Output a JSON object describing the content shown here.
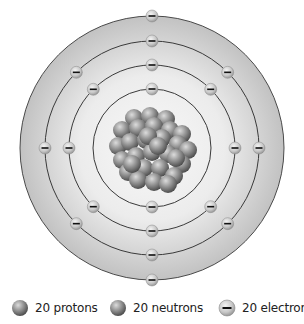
{
  "diagram": {
    "type": "bohr-atom-model",
    "element_counts": {
      "protons": 20,
      "neutrons": 20,
      "electrons": 20
    },
    "center": [
      152,
      148
    ],
    "disk_radius": 132,
    "shells": [
      {
        "radius": 59,
        "electrons": 2,
        "angles_deg": [
          90,
          270
        ]
      },
      {
        "radius": 83,
        "electrons": 8,
        "angles_deg": [
          0,
          45,
          90,
          135,
          180,
          225,
          270,
          315
        ]
      },
      {
        "radius": 107,
        "electrons": 8,
        "angles_deg": [
          0,
          45,
          90,
          135,
          180,
          225,
          270,
          315
        ]
      },
      {
        "radius": 132,
        "electrons": 2,
        "angles_deg": [
          90,
          270
        ]
      }
    ],
    "colors": {
      "disk_inner": "#f6f6f6",
      "disk_outer": "#c4c4c4",
      "orbit_line": "#3a3a3a",
      "nucleon_light": "#d6d6d6",
      "nucleon_dark": "#555555",
      "electron_light": "#eeeeee",
      "electron_dark": "#9a9a9a"
    }
  },
  "legend": {
    "items": [
      {
        "label": "20 protons",
        "icon": "proton-sphere"
      },
      {
        "label": "20 neutrons",
        "icon": "neutron-sphere"
      },
      {
        "label": "20 electrons",
        "icon": "electron-minus"
      }
    ]
  }
}
